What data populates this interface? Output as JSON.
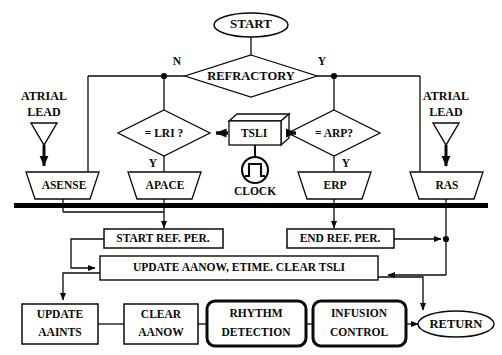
{
  "diagram": {
    "colors": {
      "ink": "#0a0a0a",
      "background": "#ffffff",
      "bus": "#000000"
    },
    "nodes": {
      "start": {
        "label": "START",
        "shape": "ellipse"
      },
      "refractory": {
        "label": "REFRACTORY",
        "shape": "diamond"
      },
      "lri": {
        "label": "= LRI ?",
        "shape": "diamond"
      },
      "arp": {
        "label": "= ARP?",
        "shape": "diamond"
      },
      "tsli": {
        "label": "TSLI",
        "shape": "cube"
      },
      "clock": {
        "label": "CLOCK",
        "shape": "clock-circle"
      },
      "atrial_lead_left": {
        "label_line1": "ATRIAL",
        "label_line2": "LEAD",
        "shape": "triangle-down"
      },
      "atrial_lead_right": {
        "label_line1": "ATRIAL",
        "label_line2": "LEAD",
        "shape": "triangle-down"
      },
      "asense": {
        "label": "ASENSE",
        "shape": "trapezoid"
      },
      "apace": {
        "label": "APACE",
        "shape": "trapezoid"
      },
      "erp": {
        "label": "ERP",
        "shape": "trapezoid"
      },
      "ras": {
        "label": "RAS",
        "shape": "trapezoid"
      },
      "start_ref_per": {
        "label": "START REF. PER.",
        "shape": "rect"
      },
      "end_ref_per": {
        "label": "END REF. PER.",
        "shape": "rect"
      },
      "update_aanow": {
        "label": "UPDATE AANOW, ETIME.  CLEAR TSLI",
        "shape": "rect"
      },
      "update_aaints": {
        "label_line1": "UPDATE",
        "label_line2": "AAINTS",
        "shape": "rect"
      },
      "clear_aanow": {
        "label_line1": "CLEAR",
        "label_line2": "AANOW",
        "shape": "rect"
      },
      "rhythm_detection": {
        "label_line1": "RHYTHM",
        "label_line2": "DETECTION",
        "shape": "rounded-rect-bold"
      },
      "infusion_control": {
        "label_line1": "INFUSION",
        "label_line2": "CONTROL",
        "shape": "rounded-rect-bold"
      },
      "return": {
        "label": "RETURN",
        "shape": "ellipse"
      }
    },
    "edge_labels": {
      "refractory_no": "N",
      "refractory_yes": "Y",
      "lri_yes": "Y",
      "arp_yes": "Y"
    }
  }
}
